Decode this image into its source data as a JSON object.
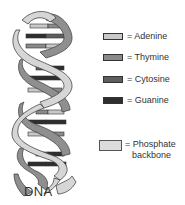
{
  "diagram": {
    "title": "DNA",
    "legend": [
      {
        "key": "adenine",
        "label": "= Adenine",
        "color": "#c8c8c8"
      },
      {
        "key": "thymine",
        "label": "= Thymine",
        "color": "#8a8a8a"
      },
      {
        "key": "cytosine",
        "label": "= Cytosine",
        "color": "#5e5e5e"
      },
      {
        "key": "guanine",
        "label": "= Guanine",
        "color": "#2e2e2e"
      }
    ],
    "phosphate": {
      "label_line1": "= Phosphate",
      "label_line2": "backbone",
      "color": "#dcdcdc"
    },
    "colors": {
      "backbone_front": "#d6d6d6",
      "backbone_back": "#8f8f8f",
      "outline": "#444444"
    }
  }
}
